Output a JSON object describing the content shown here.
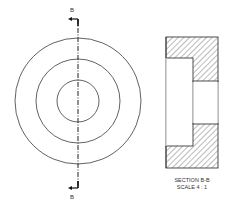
{
  "drawing": {
    "front_view": {
      "center": [
        78,
        101
      ],
      "circle_radii": [
        63,
        42,
        21
      ],
      "section_line_x": 78,
      "section_label_top": "B",
      "section_label_bottom": "B"
    },
    "section_view": {
      "title": "SECTION B-B",
      "scale": "SCALE 4 : 1",
      "outer_rect": {
        "x": 166,
        "y": 37,
        "w": 52,
        "h": 131
      },
      "counterbore": {
        "x": 166,
        "y": 58,
        "w": 27,
        "h": 88
      },
      "bore": {
        "x": 193,
        "y": 81,
        "w": 25,
        "h": 43
      }
    },
    "colors": {
      "line": "#3a3a3a",
      "hatch": "#555555",
      "background": "#ffffff"
    }
  }
}
